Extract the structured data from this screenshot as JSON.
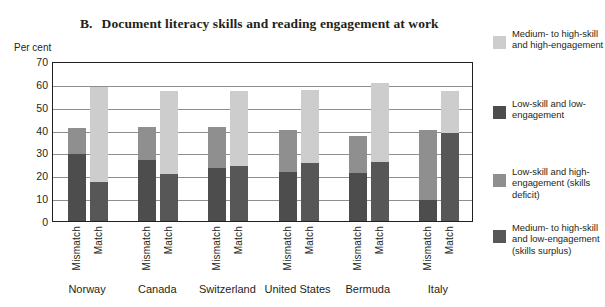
{
  "chart_data": {
    "type": "bar",
    "subtype": "stacked-grouped",
    "title_letter": "B.",
    "title_text": "Document literacy skills and reading engagement at work",
    "ylabel": "Per cent",
    "xlabel": "",
    "ylim": [
      0,
      70
    ],
    "ytick_step": 10,
    "yticks": [
      70,
      60,
      50,
      40,
      30,
      20,
      10,
      0
    ],
    "grid": true,
    "legend_position": "right",
    "categories": [
      "Norway",
      "Canada",
      "Switzerland",
      "United States",
      "Bermuda",
      "Italy"
    ],
    "subcategories": [
      "Mismatch",
      "Match"
    ],
    "series": [
      {
        "name": "Medium- to high-skill and high-engagement",
        "color": "#cdcdcd",
        "applies_to": "Match",
        "values": {
          "Norway": {
            "Mismatch": 0,
            "Match": 41.5
          },
          "Canada": {
            "Mismatch": 0,
            "Match": 36.5
          },
          "Switzerland": {
            "Mismatch": 0,
            "Match": 33.0
          },
          "United States": {
            "Mismatch": 0,
            "Match": 32.0
          },
          "Bermuda": {
            "Mismatch": 0,
            "Match": 34.5
          },
          "Italy": {
            "Mismatch": 0,
            "Match": 18.5
          }
        }
      },
      {
        "name": "Low-skill and low-engagement",
        "color": "#4d4d4d",
        "applies_to": "Mismatch",
        "values": {
          "Norway": {
            "Mismatch": 29.5,
            "Match": 0
          },
          "Canada": {
            "Mismatch": 26.5,
            "Match": 0
          },
          "Switzerland": {
            "Mismatch": 23.0,
            "Match": 0
          },
          "United States": {
            "Mismatch": 21.5,
            "Match": 0
          },
          "Bermuda": {
            "Mismatch": 21.0,
            "Match": 0
          },
          "Italy": {
            "Mismatch": 9.0,
            "Match": 0
          }
        }
      },
      {
        "name": "Low-skill and high-engagement (skills deficit)",
        "color": "#8f8f8f",
        "applies_to": "Mismatch",
        "values": {
          "Norway": {
            "Mismatch": 11.0,
            "Match": 0
          },
          "Canada": {
            "Mismatch": 14.5,
            "Match": 0
          },
          "Switzerland": {
            "Mismatch": 18.0,
            "Match": 0
          },
          "United States": {
            "Mismatch": 18.5,
            "Match": 0
          },
          "Bermuda": {
            "Mismatch": 16.0,
            "Match": 0
          },
          "Italy": {
            "Mismatch": 31.0,
            "Match": 0
          }
        }
      },
      {
        "name": "Medium- to high-skill and low-engagement (skills surplus)",
        "color": "#575757",
        "applies_to": "Match",
        "values": {
          "Norway": {
            "Mismatch": 0,
            "Match": 17.0
          },
          "Canada": {
            "Mismatch": 0,
            "Match": 20.5
          },
          "Switzerland": {
            "Mismatch": 0,
            "Match": 24.0
          },
          "United States": {
            "Mismatch": 0,
            "Match": 25.5
          },
          "Bermuda": {
            "Mismatch": 0,
            "Match": 26.0
          },
          "Italy": {
            "Mismatch": 0,
            "Match": 38.5
          }
        }
      }
    ],
    "bar_totals": {
      "Norway": {
        "Mismatch": 40.5,
        "Match": 58.5
      },
      "Canada": {
        "Mismatch": 41.0,
        "Match": 57.0
      },
      "Switzerland": {
        "Mismatch": 41.0,
        "Match": 57.0
      },
      "United States": {
        "Mismatch": 40.0,
        "Match": 57.5
      },
      "Bermuda": {
        "Mismatch": 37.0,
        "Match": 60.5
      },
      "Italy": {
        "Mismatch": 40.0,
        "Match": 57.0
      }
    }
  },
  "axis": {
    "unit_label": "Per cent",
    "tick_labels": [
      "70",
      "60",
      "50",
      "40",
      "30",
      "20",
      "10",
      "0"
    ]
  },
  "groups": [
    {
      "label": "Norway",
      "bars": [
        {
          "label": "Mismatch",
          "segments": [
            {
              "series": 1,
              "value": 29.5,
              "color": "#4d4d4d"
            },
            {
              "series": 2,
              "value": 11.0,
              "color": "#8f8f8f"
            }
          ]
        },
        {
          "label": "Match",
          "segments": [
            {
              "series": 3,
              "value": 17.0,
              "color": "#575757"
            },
            {
              "series": 0,
              "value": 41.5,
              "color": "#cdcdcd"
            }
          ]
        }
      ]
    },
    {
      "label": "Canada",
      "bars": [
        {
          "label": "Mismatch",
          "segments": [
            {
              "series": 1,
              "value": 26.5,
              "color": "#4d4d4d"
            },
            {
              "series": 2,
              "value": 14.5,
              "color": "#8f8f8f"
            }
          ]
        },
        {
          "label": "Match",
          "segments": [
            {
              "series": 3,
              "value": 20.5,
              "color": "#575757"
            },
            {
              "series": 0,
              "value": 36.5,
              "color": "#cdcdcd"
            }
          ]
        }
      ]
    },
    {
      "label": "Switzerland",
      "bars": [
        {
          "label": "Mismatch",
          "segments": [
            {
              "series": 1,
              "value": 23.0,
              "color": "#4d4d4d"
            },
            {
              "series": 2,
              "value": 18.0,
              "color": "#8f8f8f"
            }
          ]
        },
        {
          "label": "Match",
          "segments": [
            {
              "series": 3,
              "value": 24.0,
              "color": "#575757"
            },
            {
              "series": 0,
              "value": 33.0,
              "color": "#cdcdcd"
            }
          ]
        }
      ]
    },
    {
      "label": "United States",
      "bars": [
        {
          "label": "Mismatch",
          "segments": [
            {
              "series": 1,
              "value": 21.5,
              "color": "#4d4d4d"
            },
            {
              "series": 2,
              "value": 18.5,
              "color": "#8f8f8f"
            }
          ]
        },
        {
          "label": "Match",
          "segments": [
            {
              "series": 3,
              "value": 25.5,
              "color": "#575757"
            },
            {
              "series": 0,
              "value": 32.0,
              "color": "#cdcdcd"
            }
          ]
        }
      ]
    },
    {
      "label": "Bermuda",
      "bars": [
        {
          "label": "Mismatch",
          "segments": [
            {
              "series": 1,
              "value": 21.0,
              "color": "#4d4d4d"
            },
            {
              "series": 2,
              "value": 16.0,
              "color": "#8f8f8f"
            }
          ]
        },
        {
          "label": "Match",
          "segments": [
            {
              "series": 3,
              "value": 26.0,
              "color": "#575757"
            },
            {
              "series": 0,
              "value": 34.5,
              "color": "#cdcdcd"
            }
          ]
        }
      ]
    },
    {
      "label": "Italy",
      "bars": [
        {
          "label": "Mismatch",
          "segments": [
            {
              "series": 1,
              "value": 9.0,
              "color": "#4d4d4d"
            },
            {
              "series": 2,
              "value": 31.0,
              "color": "#8f8f8f"
            }
          ]
        },
        {
          "label": "Match",
          "segments": [
            {
              "series": 3,
              "value": 38.5,
              "color": "#575757"
            },
            {
              "series": 0,
              "value": 18.5,
              "color": "#cdcdcd"
            }
          ]
        }
      ]
    }
  ],
  "legend": {
    "items": [
      {
        "label": "Medium- to high-skill and high-engagement",
        "color": "#cdcdcd"
      },
      {
        "label": "Low-skill and low-engagement",
        "color": "#4d4d4d"
      },
      {
        "label": "Low-skill and high-engagement (skills deficit)",
        "color": "#8f8f8f"
      },
      {
        "label": "Medium- to high-skill and low-engagement (skills surplus)",
        "color": "#575757"
      }
    ],
    "tops": [
      14,
      84,
      152,
      208
    ]
  }
}
